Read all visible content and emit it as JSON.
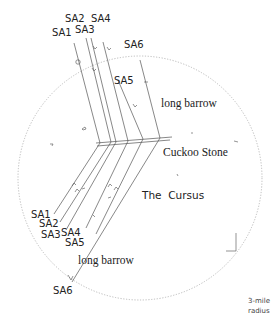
{
  "diagram": {
    "type": "sightline map",
    "radius_label_line1": "3-mile",
    "radius_label_line2": "radius",
    "places": {
      "long_barrow_north": "long barrow",
      "cuckoo_stone": "Cuckoo Stone",
      "cursus": "The  Cursus",
      "long_barrow_south": "long barrow"
    },
    "alignments_north": [
      "SA1",
      "SA2",
      "SA3",
      "SA4",
      "SA5",
      "SA6"
    ],
    "alignments_south": [
      "SA1",
      "SA2",
      "SA3",
      "SA4",
      "SA5",
      "SA6"
    ],
    "colors": {
      "line": "#555555",
      "radius_circle": "#bbbbbb",
      "text": "#222222"
    }
  }
}
